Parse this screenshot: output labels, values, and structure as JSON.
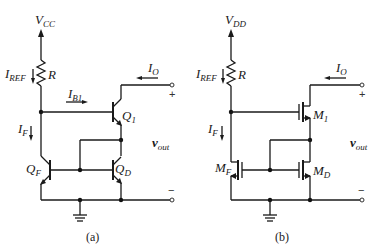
{
  "figure": {
    "circuit_a": {
      "caption": "(a)",
      "supply": {
        "main": "V",
        "sub": "CC"
      },
      "reference_current": {
        "main": "I",
        "sub": "REF"
      },
      "resistor": "R",
      "base_current": {
        "main": "I",
        "sub": "B1"
      },
      "feedback_current": {
        "main": "I",
        "sub": "F"
      },
      "output_current": {
        "main": "I",
        "sub": "O"
      },
      "transistor_top": {
        "main": "Q",
        "sub": "1"
      },
      "transistor_left": {
        "main": "Q",
        "sub": "F"
      },
      "transistor_right": {
        "main": "Q",
        "sub": "D"
      },
      "output_voltage": {
        "main": "v",
        "sub": "out"
      },
      "plus": "+",
      "minus": "−"
    },
    "circuit_b": {
      "caption": "(b)",
      "supply": {
        "main": "V",
        "sub": "DD"
      },
      "reference_current": {
        "main": "I",
        "sub": "REF"
      },
      "resistor": "R",
      "feedback_current": {
        "main": "I",
        "sub": "F"
      },
      "output_current": {
        "main": "I",
        "sub": "O"
      },
      "transistor_top": {
        "main": "M",
        "sub": "1"
      },
      "transistor_left": {
        "main": "M",
        "sub": "F"
      },
      "transistor_right": {
        "main": "M",
        "sub": "D"
      },
      "output_voltage": {
        "main": "v",
        "sub": "out"
      },
      "plus": "+",
      "minus": "−"
    }
  }
}
